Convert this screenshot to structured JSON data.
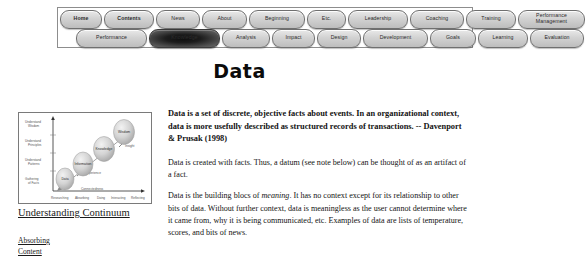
{
  "page": {
    "title": "Data"
  },
  "nav": {
    "row1": [
      {
        "label": "Home",
        "bold": true,
        "active": false,
        "width": 30
      },
      {
        "label": "Contents",
        "bold": true,
        "active": false,
        "width": 38
      },
      {
        "label": "News",
        "bold": false,
        "active": false,
        "width": 32
      },
      {
        "label": "About",
        "bold": false,
        "active": false,
        "width": 33
      },
      {
        "label": "Beginning",
        "bold": false,
        "active": false,
        "width": 44
      },
      {
        "label": "Etc.",
        "bold": false,
        "active": false,
        "width": 27
      },
      {
        "label": "Leadership",
        "bold": false,
        "active": false,
        "width": 48
      },
      {
        "label": "Coaching",
        "bold": false,
        "active": false,
        "width": 42
      },
      {
        "label": "Training",
        "bold": false,
        "active": false,
        "width": 38
      },
      {
        "label": "Performance Management",
        "bold": false,
        "active": false,
        "width": 57,
        "two_line": true
      }
    ],
    "row2": [
      {
        "label": "Performance",
        "bold": false,
        "active": false,
        "width": 59
      },
      {
        "label": "Knowledge",
        "bold": false,
        "active": true,
        "width": 59
      },
      {
        "label": "Analysis",
        "bold": false,
        "active": false,
        "width": 36
      },
      {
        "label": "Impact",
        "bold": false,
        "active": false,
        "width": 31
      },
      {
        "label": "Design",
        "bold": false,
        "active": false,
        "width": 32
      },
      {
        "label": "Development",
        "bold": false,
        "active": false,
        "width": 53
      },
      {
        "label": "Goals",
        "bold": false,
        "active": false,
        "width": 34
      },
      {
        "label": "Learning",
        "bold": false,
        "active": false,
        "width": 38
      },
      {
        "label": "Evaluation",
        "bold": false,
        "active": false,
        "width": 42
      }
    ]
  },
  "diagram": {
    "caption": "Understanding Continuum",
    "y_axis_labels": [
      "Understand Wisdom",
      "Understand Principles",
      "Understand Patterns",
      "Understand Relations",
      "Researching Absorbing"
    ],
    "x_axis_label": "Connectedness",
    "x_tick_labels": [
      "Researching",
      "Absorbing",
      "Doing",
      "Interacting",
      "Reflecting"
    ],
    "bubbles": [
      {
        "label": "Data"
      },
      {
        "label": "Information"
      },
      {
        "label": "Knowledge"
      },
      {
        "label": "Wisdom"
      }
    ],
    "arrow_labels": [
      "Experience",
      "Insight"
    ]
  },
  "left_links": [
    {
      "label": "Absorbing"
    },
    {
      "label": "Content"
    }
  ],
  "body": {
    "lead": "Data is a set of discrete, objective facts about events. In an organizational context, data is more usefully described as structured records of transactions. -- Davenport & Prusak (1998)",
    "p2": "Data is created with facts. Thus, a datum (see note below) can be thought of as an artifact of a fact.",
    "p3_part1": "Data is the building blocs of ",
    "p3_em": "meaning",
    "p3_part2": ". It has no context except for its relationship to other bits of data. Without further context, data is meaningless as the user cannot determine where it came from, why it is being communicated, etc. Examples of data are lists of temperature, scores, and bits of news."
  },
  "colors": {
    "button_face": "#d2d2d2",
    "button_border": "#6f6f6f",
    "active_button": "#141414",
    "text": "#131313",
    "frame_border": "#7a7a7a"
  }
}
